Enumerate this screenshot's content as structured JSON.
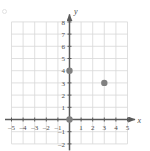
{
  "chart_data": {
    "type": "scatter",
    "title": "",
    "xlabel": "x",
    "ylabel": "y",
    "xlim": [
      -5.6,
      5.6
    ],
    "ylim": [
      -2.4,
      8.6
    ],
    "grid": true,
    "grid_range_x": [
      -5,
      5
    ],
    "grid_range_y": [
      -2,
      8
    ],
    "legend": "none",
    "x_ticks": [
      -5,
      -4,
      -3,
      -2,
      -1,
      1,
      2,
      3,
      4,
      5
    ],
    "x_tick_labels": [
      "–5",
      "–4",
      "–3",
      "–2",
      "–1",
      "1",
      "2",
      "3",
      "4",
      "5"
    ],
    "y_ticks": [
      8,
      7,
      6,
      5,
      4,
      3,
      2,
      1,
      -1,
      -2
    ],
    "y_tick_labels": [
      "8",
      "7",
      "6",
      "5",
      "4",
      "3",
      "2",
      "1",
      "–1",
      "–2"
    ],
    "points": [
      {
        "name": "point-origin",
        "x": 0,
        "y": 0
      },
      {
        "name": "point-y-intercept",
        "x": 0,
        "y": 4
      },
      {
        "name": "point-three-three",
        "x": 3,
        "y": 3
      }
    ],
    "point_color": "#808080",
    "point_radius": 3.2,
    "grid_color": "#d8d8d8",
    "axis_color": "#5a5a5a",
    "label_color": "#4a4a4a"
  }
}
